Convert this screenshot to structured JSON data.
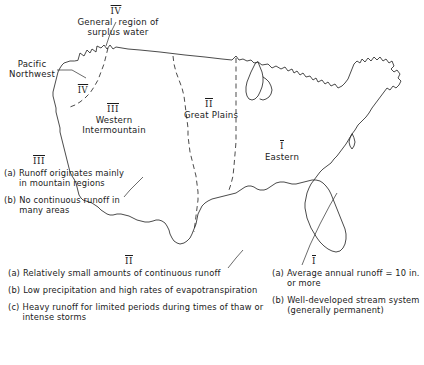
{
  "figure": {
    "title_region_iv": "IV",
    "label_iv_general": "General  region of\nsurplus water",
    "label_pacific_northwest": "Pacific\nNorthwest",
    "marker_iv_pnw": "IV",
    "marker_iii": "III",
    "label_iii_region": "Western\nIntermountain",
    "marker_ii": "II",
    "label_ii_region": "Great Plains",
    "marker_i": "I",
    "label_i_region": "Eastern"
  },
  "notes": {
    "iii": {
      "heading": "III",
      "items": [
        {
          "tag": "(a)",
          "text": "Runoff\noriginates\nmainly in\nmountain regions"
        },
        {
          "tag": "(b)",
          "text": "No continuous runoff\nin many areas"
        }
      ]
    },
    "ii": {
      "heading": "II",
      "items": [
        {
          "tag": "(a)",
          "text": "Relatively small amounts of continuous\nrunoff"
        },
        {
          "tag": "(b)",
          "text": "Low precipitation and high rates of\nevapotranspiration"
        },
        {
          "tag": "(c)",
          "text": "Heavy runoff for limited periods during\ntimes of thaw or intense storms"
        }
      ]
    },
    "i": {
      "heading": "I",
      "items": [
        {
          "tag": "(a)",
          "text": "Average annual\nrunoff = 10 in. or more"
        },
        {
          "tag": "(b)",
          "text": "Well-developed stream\nsystem (generally\npermanent)"
        }
      ]
    }
  },
  "caption": {
    "text": ""
  },
  "colors": {
    "ink": "#2b2b2b",
    "background": "#ffffff"
  }
}
